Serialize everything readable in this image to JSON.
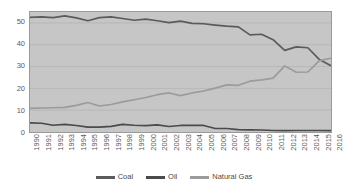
{
  "chart_data": {
    "type": "line",
    "title": "",
    "subtitle": "",
    "xlabel": "",
    "ylabel": "",
    "xlim": [
      1990,
      2016
    ],
    "ylim": [
      0,
      55
    ],
    "yticks": [
      0,
      10,
      20,
      30,
      40,
      50
    ],
    "grid": true,
    "legend_position": "bottom",
    "categories": [
      "1990",
      "1991",
      "1992",
      "1993",
      "1994",
      "1995",
      "1996",
      "1997",
      "1998",
      "1999",
      "2000",
      "2001",
      "2002",
      "2003",
      "2004",
      "2005",
      "2006",
      "2007",
      "2008",
      "2009",
      "2010",
      "2011",
      "2012",
      "2013",
      "2014",
      "2015",
      "2016"
    ],
    "series": [
      {
        "name": "Coal",
        "color": "#5b5b5b",
        "values": [
          52.5,
          52.8,
          52.4,
          53.2,
          52.3,
          51.0,
          52.4,
          52.8,
          52.0,
          51.2,
          51.7,
          51.0,
          50.1,
          50.8,
          49.8,
          49.6,
          49.0,
          48.5,
          48.2,
          44.5,
          44.8,
          42.3,
          37.4,
          39.0,
          38.6,
          33.2,
          30.4
        ]
      },
      {
        "name": "Oil",
        "color": "#4a4a4a",
        "values": [
          4.2,
          4.0,
          3.1,
          3.5,
          3.0,
          2.2,
          2.2,
          2.6,
          3.5,
          3.1,
          2.9,
          3.3,
          2.5,
          3.0,
          3.0,
          3.0,
          1.6,
          1.6,
          1.1,
          1.0,
          0.9,
          0.7,
          0.6,
          0.7,
          0.7,
          0.7,
          0.6
        ]
      },
      {
        "name": "Natural Gas",
        "color": "#9b9b9b",
        "values": [
          10.8,
          11.0,
          11.1,
          11.3,
          12.2,
          13.5,
          11.9,
          12.6,
          13.8,
          14.8,
          15.8,
          17.1,
          17.9,
          16.7,
          17.9,
          18.8,
          20.1,
          21.6,
          21.4,
          23.3,
          23.9,
          24.7,
          30.3,
          27.4,
          27.5,
          32.7,
          33.8
        ]
      }
    ]
  },
  "legend": {
    "entries": [
      {
        "label": "Coal"
      },
      {
        "label": "Oil"
      },
      {
        "label": "Natural Gas"
      }
    ]
  }
}
